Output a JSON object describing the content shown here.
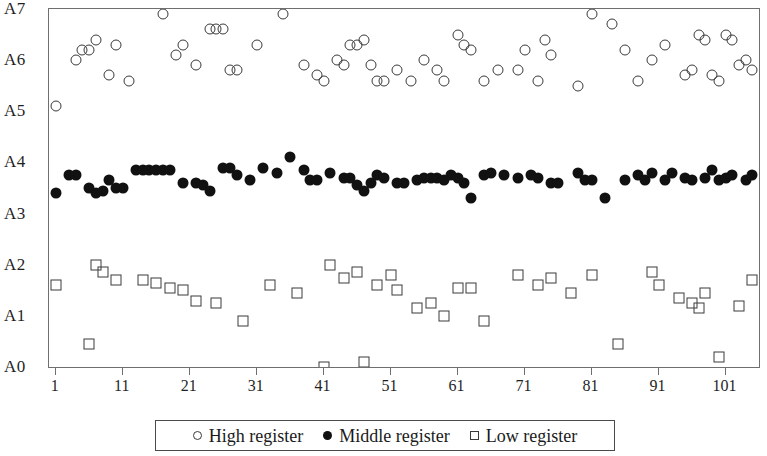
{
  "chart_data": {
    "type": "scatter",
    "title": "",
    "xlabel": "",
    "ylabel": "",
    "grid": false,
    "legend_position": "bottom",
    "xlim": [
      0.0,
      106.0
    ],
    "ylim": [
      0,
      7
    ],
    "x_ticks": [
      1,
      11,
      21,
      31,
      41,
      51,
      61,
      71,
      81,
      91,
      101
    ],
    "x_tick_labels": [
      "1",
      "11",
      "21",
      "31",
      "41",
      "51",
      "61",
      "71",
      "81",
      "91",
      "101"
    ],
    "y_ticks": [
      0,
      1,
      2,
      3,
      4,
      5,
      6,
      7
    ],
    "y_tick_labels": [
      "A0",
      "A1",
      "A2",
      "A3",
      "A4",
      "A5",
      "A6",
      "A7"
    ],
    "series": [
      {
        "name": "High register",
        "marker": "open-circle",
        "color": "#3a3a3a",
        "points": [
          [
            1,
            5.1
          ],
          [
            4,
            6.0
          ],
          [
            5,
            6.2
          ],
          [
            6,
            6.2
          ],
          [
            7,
            6.4
          ],
          [
            9,
            5.7
          ],
          [
            10,
            6.3
          ],
          [
            12,
            5.6
          ],
          [
            17,
            6.9
          ],
          [
            19,
            6.1
          ],
          [
            20,
            6.3
          ],
          [
            22,
            5.9
          ],
          [
            24,
            6.6
          ],
          [
            25,
            6.6
          ],
          [
            26,
            6.6
          ],
          [
            27,
            5.8
          ],
          [
            28,
            5.8
          ],
          [
            31,
            6.3
          ],
          [
            35,
            6.9
          ],
          [
            38,
            5.9
          ],
          [
            40,
            5.7
          ],
          [
            41,
            5.6
          ],
          [
            43,
            6.0
          ],
          [
            44,
            5.9
          ],
          [
            45,
            6.3
          ],
          [
            46,
            6.3
          ],
          [
            47,
            6.4
          ],
          [
            48,
            5.9
          ],
          [
            49,
            5.6
          ],
          [
            50,
            5.6
          ],
          [
            52,
            5.8
          ],
          [
            54,
            5.6
          ],
          [
            56,
            6.0
          ],
          [
            58,
            5.8
          ],
          [
            59,
            5.6
          ],
          [
            61,
            6.5
          ],
          [
            62,
            6.3
          ],
          [
            63,
            6.2
          ],
          [
            65,
            5.6
          ],
          [
            67,
            5.8
          ],
          [
            70,
            5.8
          ],
          [
            71,
            6.2
          ],
          [
            73,
            5.6
          ],
          [
            74,
            6.4
          ],
          [
            75,
            6.1
          ],
          [
            79,
            5.5
          ],
          [
            81,
            6.9
          ],
          [
            84,
            6.7
          ],
          [
            86,
            6.2
          ],
          [
            88,
            5.6
          ],
          [
            90,
            6.0
          ],
          [
            92,
            6.3
          ],
          [
            95,
            5.7
          ],
          [
            96,
            5.8
          ],
          [
            97,
            6.5
          ],
          [
            98,
            6.4
          ],
          [
            99,
            5.7
          ],
          [
            100,
            5.6
          ],
          [
            101,
            6.5
          ],
          [
            102,
            6.4
          ],
          [
            103,
            5.9
          ],
          [
            104,
            6.0
          ],
          [
            105,
            5.8
          ]
        ]
      },
      {
        "name": "Middle register",
        "marker": "filled-circle",
        "color": "#111111",
        "points": [
          [
            1,
            3.4
          ],
          [
            3,
            3.75
          ],
          [
            4,
            3.75
          ],
          [
            6,
            3.5
          ],
          [
            7,
            3.4
          ],
          [
            8,
            3.45
          ],
          [
            9,
            3.65
          ],
          [
            10,
            3.5
          ],
          [
            11,
            3.5
          ],
          [
            13,
            3.85
          ],
          [
            14,
            3.85
          ],
          [
            15,
            3.85
          ],
          [
            16,
            3.85
          ],
          [
            17,
            3.85
          ],
          [
            18,
            3.85
          ],
          [
            20,
            3.6
          ],
          [
            22,
            3.6
          ],
          [
            23,
            3.55
          ],
          [
            24,
            3.45
          ],
          [
            26,
            3.9
          ],
          [
            27,
            3.9
          ],
          [
            28,
            3.75
          ],
          [
            30,
            3.65
          ],
          [
            32,
            3.9
          ],
          [
            34,
            3.8
          ],
          [
            36,
            4.1
          ],
          [
            38,
            3.85
          ],
          [
            39,
            3.65
          ],
          [
            40,
            3.65
          ],
          [
            42,
            3.8
          ],
          [
            44,
            3.7
          ],
          [
            45,
            3.7
          ],
          [
            46,
            3.55
          ],
          [
            47,
            3.45
          ],
          [
            48,
            3.6
          ],
          [
            49,
            3.75
          ],
          [
            50,
            3.7
          ],
          [
            52,
            3.6
          ],
          [
            53,
            3.6
          ],
          [
            55,
            3.65
          ],
          [
            56,
            3.7
          ],
          [
            57,
            3.7
          ],
          [
            58,
            3.7
          ],
          [
            59,
            3.65
          ],
          [
            60,
            3.75
          ],
          [
            61,
            3.7
          ],
          [
            62,
            3.6
          ],
          [
            63,
            3.3
          ],
          [
            65,
            3.75
          ],
          [
            66,
            3.8
          ],
          [
            68,
            3.75
          ],
          [
            70,
            3.7
          ],
          [
            72,
            3.75
          ],
          [
            73,
            3.7
          ],
          [
            75,
            3.6
          ],
          [
            76,
            3.6
          ],
          [
            79,
            3.8
          ],
          [
            80,
            3.65
          ],
          [
            81,
            3.65
          ],
          [
            83,
            3.3
          ],
          [
            86,
            3.65
          ],
          [
            88,
            3.75
          ],
          [
            89,
            3.65
          ],
          [
            90,
            3.8
          ],
          [
            92,
            3.65
          ],
          [
            93,
            3.8
          ],
          [
            95,
            3.7
          ],
          [
            96,
            3.65
          ],
          [
            98,
            3.7
          ],
          [
            99,
            3.85
          ],
          [
            100,
            3.65
          ],
          [
            101,
            3.7
          ],
          [
            102,
            3.75
          ],
          [
            104,
            3.65
          ],
          [
            105,
            3.75
          ]
        ]
      },
      {
        "name": "Low register",
        "marker": "open-square",
        "color": "#3a3a3a",
        "points": [
          [
            1,
            1.6
          ],
          [
            6,
            0.45
          ],
          [
            7,
            2.0
          ],
          [
            8,
            1.85
          ],
          [
            10,
            1.7
          ],
          [
            14,
            1.7
          ],
          [
            16,
            1.65
          ],
          [
            18,
            1.55
          ],
          [
            20,
            1.5
          ],
          [
            22,
            1.3
          ],
          [
            25,
            1.25
          ],
          [
            29,
            0.9
          ],
          [
            33,
            1.6
          ],
          [
            37,
            1.45
          ],
          [
            41,
            0.0
          ],
          [
            42,
            2.0
          ],
          [
            44,
            1.75
          ],
          [
            46,
            1.85
          ],
          [
            47,
            0.1
          ],
          [
            49,
            1.6
          ],
          [
            51,
            1.8
          ],
          [
            52,
            1.5
          ],
          [
            55,
            1.15
          ],
          [
            57,
            1.25
          ],
          [
            59,
            1.0
          ],
          [
            61,
            1.55
          ],
          [
            63,
            1.55
          ],
          [
            65,
            0.9
          ],
          [
            70,
            1.8
          ],
          [
            73,
            1.6
          ],
          [
            75,
            1.75
          ],
          [
            78,
            1.45
          ],
          [
            81,
            1.8
          ],
          [
            85,
            0.45
          ],
          [
            90,
            1.85
          ],
          [
            91,
            1.6
          ],
          [
            94,
            1.35
          ],
          [
            96,
            1.25
          ],
          [
            97,
            1.15
          ],
          [
            98,
            1.45
          ],
          [
            100,
            0.2
          ],
          [
            103,
            1.2
          ],
          [
            105,
            1.7
          ]
        ]
      }
    ]
  },
  "legend": {
    "items": [
      {
        "label": "High register",
        "marker": "high"
      },
      {
        "label": "Middle register",
        "marker": "middle"
      },
      {
        "label": "Low register",
        "marker": "low"
      }
    ]
  }
}
